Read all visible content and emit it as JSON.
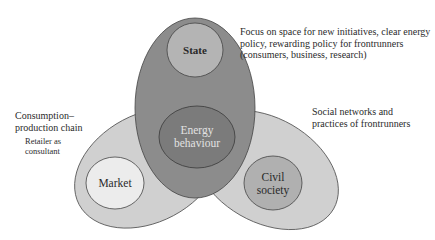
{
  "diagram": {
    "nodes": {
      "state": {
        "label": "State",
        "fill": "#b4b4b4"
      },
      "energy": {
        "label_line1": "Energy",
        "label_line2": "behaviour",
        "fill": "#7b7b7b",
        "text_color": "#e0e0e0"
      },
      "market": {
        "label": "Market",
        "fill": "#ececec"
      },
      "civil": {
        "label_line1": "Civil",
        "label_line2": "society",
        "fill": "#b0b0b0"
      }
    },
    "regions": {
      "central": {
        "fill": "#8c8c8c"
      },
      "left_lobe": {
        "fill": "#d0d0d0"
      },
      "right_lobe": {
        "fill": "#d0d0d0"
      }
    },
    "annotations": {
      "state_note": {
        "line1": "Focus on space for new initiatives, clear energy",
        "line2": "policy, rewarding policy for frontrunners",
        "line3": "(consumers, business, research)"
      },
      "market_note": {
        "line1": "Consumption–",
        "line2": "production chain",
        "sub_line1": "Retailer as",
        "sub_line2": "consultant"
      },
      "civil_note": {
        "line1": "Social networks and",
        "line2": "practices of frontrunners"
      }
    }
  }
}
